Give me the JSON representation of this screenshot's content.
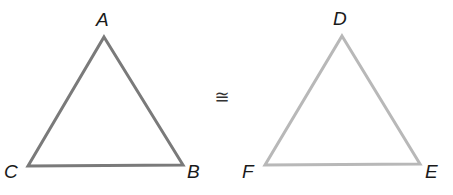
{
  "diagram": {
    "type": "congruent-triangles",
    "relation_symbol": "≅",
    "relation_position": {
      "x": 222,
      "y": 103
    },
    "triangles": [
      {
        "id": "ABC",
        "stroke": "#7a7a7a",
        "stroke_width": 3,
        "vertices": {
          "A": {
            "x": 104,
            "y": 37
          },
          "B": {
            "x": 183,
            "y": 165
          },
          "C": {
            "x": 28,
            "y": 166
          }
        },
        "labels": {
          "A": {
            "text": "A",
            "x": 96,
            "y": 26
          },
          "B": {
            "text": "B",
            "x": 187,
            "y": 178
          },
          "C": {
            "text": "C",
            "x": 4,
            "y": 178
          }
        }
      },
      {
        "id": "DEF",
        "stroke": "#b8b8b8",
        "stroke_width": 3,
        "vertices": {
          "D": {
            "x": 342,
            "y": 36
          },
          "E": {
            "x": 420,
            "y": 164
          },
          "F": {
            "x": 265,
            "y": 165
          }
        },
        "labels": {
          "D": {
            "text": "D",
            "x": 333,
            "y": 25
          },
          "E": {
            "text": "E",
            "x": 425,
            "y": 178
          },
          "F": {
            "text": "F",
            "x": 242,
            "y": 178
          }
        }
      }
    ]
  }
}
